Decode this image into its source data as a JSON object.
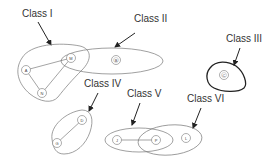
{
  "diagram": {
    "classes": [
      {
        "id": "I",
        "label": "Class I",
        "members": [
          "A",
          "M",
          "N"
        ]
      },
      {
        "id": "II",
        "label": "Class II",
        "members": [
          "M",
          "B"
        ]
      },
      {
        "id": "III",
        "label": "Class III",
        "members": [
          "C"
        ]
      },
      {
        "id": "IV",
        "label": "Class IV",
        "members": [
          "D",
          "G"
        ]
      },
      {
        "id": "V",
        "label": "Class V",
        "members": [
          "J",
          "P"
        ]
      },
      {
        "id": "VI",
        "label": "Class VI",
        "members": [
          "P",
          "L"
        ]
      }
    ],
    "nodes": {
      "A": "A",
      "M": "M",
      "N": "N",
      "B": "B",
      "C": "C",
      "D": "D",
      "G": "G",
      "J": "J",
      "P": "P",
      "L": "L"
    },
    "edges": [
      [
        "A",
        "M"
      ],
      [
        "A",
        "N"
      ],
      [
        "M",
        "N"
      ],
      [
        "D",
        "G"
      ],
      [
        "J",
        "P"
      ]
    ],
    "colors": {
      "region_stroke": "#777777",
      "class3_stroke": "#222222",
      "arrow": "#222222",
      "text": "#333333"
    }
  }
}
